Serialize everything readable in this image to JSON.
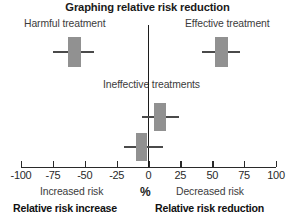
{
  "title": "Graphing relative risk reduction",
  "annotations": {
    "harmful": "Harmful treatment",
    "effective": "Effective treatment",
    "ineffective": "Ineffective treatments"
  },
  "axis": {
    "unit_symbol": "%",
    "tick_labels": [
      "-100",
      "-75",
      "-50",
      "-25",
      "0",
      "25",
      "50",
      "75",
      "100"
    ]
  },
  "captions": {
    "left_sub": "Increased risk",
    "right_sub": "Decreased risk",
    "left_bold": "Relative risk increase",
    "right_bold": "Relative risk reduction"
  },
  "colors": {
    "box_fill": "#919191",
    "whisker": "#4a4a4a",
    "axis": "#2a2a2a",
    "zero_line": "#1c1c1c",
    "background": "#ffffff"
  },
  "chart_data": {
    "type": "scatter",
    "subtype": "forest-plot",
    "title": "Graphing relative risk reduction",
    "xlabel": "%",
    "ylabel": "",
    "xlim": [
      -100,
      100
    ],
    "xticks": [
      -100,
      -75,
      -50,
      -25,
      0,
      25,
      50,
      75,
      100
    ],
    "grid": false,
    "legend": "none",
    "reference_line_x": 0,
    "points": [
      {
        "group": "Harmful treatment",
        "estimate": -58,
        "ci_low": -75,
        "ci_high": -43,
        "box_low": -63,
        "box_high": -53,
        "row": 1
      },
      {
        "group": "Effective treatment",
        "estimate": 57,
        "ci_low": 42,
        "ci_high": 72,
        "box_low": 52,
        "box_high": 62,
        "row": 1
      },
      {
        "group": "Ineffective treatments",
        "estimate": 9,
        "ci_low": -5,
        "ci_high": 24,
        "box_low": 4,
        "box_high": 14,
        "row": 2
      },
      {
        "group": "Ineffective treatments",
        "estimate": -5,
        "ci_low": -19,
        "ci_high": 11,
        "box_low": -10,
        "box_high": -1,
        "row": 3
      }
    ]
  }
}
